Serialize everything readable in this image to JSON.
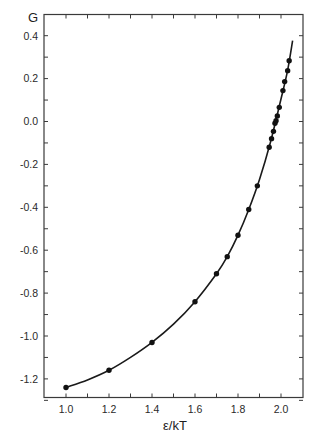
{
  "chart_data": {
    "type": "line",
    "title": "",
    "xlabel": "ε/kT",
    "ylabel": "G",
    "xlim": [
      0.93,
      2.11
    ],
    "ylim": [
      -1.31,
      0.49
    ],
    "grid": false,
    "legend": null,
    "x_ticks": [
      1.0,
      1.2,
      1.4,
      1.6,
      1.8,
      2.0
    ],
    "x_tick_labels": [
      "1.0",
      "1.2",
      "1.4",
      "1.6",
      "1.8",
      "2.0"
    ],
    "x_minor_step": 0.1,
    "y_ticks": [
      0.4,
      0.2,
      0.0,
      -0.2,
      -0.4,
      -0.6,
      -0.8,
      -1.0,
      -1.2
    ],
    "y_tick_labels": [
      "0.4",
      "0.2",
      "0.0",
      "-0.2",
      "-0.4",
      "-0.6",
      "-0.8",
      "-1.0",
      "-1.2"
    ],
    "y_minor_step": 0.1,
    "series": [
      {
        "name": "data points",
        "style": "markers",
        "x": [
          1.0,
          1.2,
          1.4,
          1.6,
          1.7,
          1.75,
          1.8,
          1.85,
          1.89,
          1.945,
          1.956,
          1.965,
          1.972,
          1.977,
          1.983,
          1.992,
          2.009,
          2.017,
          2.031,
          2.038
        ],
        "y": [
          -1.24,
          -1.16,
          -1.03,
          -0.84,
          -0.71,
          -0.63,
          -0.53,
          -0.41,
          -0.3,
          -0.12,
          -0.08,
          -0.046,
          -0.008,
          0.004,
          0.026,
          0.066,
          0.144,
          0.186,
          0.237,
          0.283
        ]
      },
      {
        "name": "fitted curve",
        "style": "line",
        "x": [
          1.0,
          1.1,
          1.2,
          1.3,
          1.4,
          1.5,
          1.6,
          1.7,
          1.75,
          1.8,
          1.85,
          1.9,
          1.95,
          2.0,
          2.03,
          2.054
        ],
        "y": [
          -1.24,
          -1.205,
          -1.16,
          -1.1,
          -1.03,
          -0.945,
          -0.84,
          -0.71,
          -0.63,
          -0.53,
          -0.41,
          -0.27,
          -0.1,
          0.105,
          0.235,
          0.377
        ]
      }
    ]
  },
  "axes": {
    "y_title": "G",
    "x_title": "ε/kT"
  }
}
